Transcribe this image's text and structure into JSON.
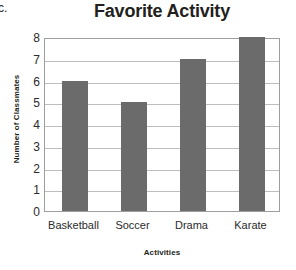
{
  "question_label": "c.",
  "chart_data": {
    "type": "bar",
    "title": "Favorite Activity",
    "xlabel": "Activities",
    "ylabel": "Number of Classmates",
    "categories": [
      "Basketball",
      "Soccer",
      "Drama",
      "Karate"
    ],
    "values": [
      6,
      5,
      7,
      8
    ],
    "ylim": [
      0,
      8
    ],
    "ytick_labels": [
      "0",
      "1",
      "2",
      "3",
      "4",
      "5",
      "6",
      "7",
      "8"
    ],
    "ytick_values": [
      0,
      1,
      2,
      3,
      4,
      5,
      6,
      7,
      8
    ],
    "grid": true,
    "legend": false,
    "bar_color": "#6b6b6b",
    "grid_color": "#bdbdbd",
    "frame_color": "#9e9e9e",
    "background_color": "#ffffff",
    "text_color": "#231f20"
  }
}
